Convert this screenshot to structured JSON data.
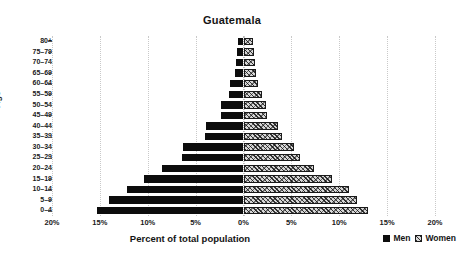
{
  "chart_data": {
    "type": "bar",
    "subtype": "population-pyramid",
    "title": "Guatemala",
    "xlabel": "Percent of total population",
    "ylabel": "Age",
    "categories": [
      "0–4",
      "5–9",
      "10–14",
      "15–19",
      "20–24",
      "25–29",
      "30–34",
      "35–39",
      "40–44",
      "45–49",
      "50–54",
      "55–59",
      "60–64",
      "65–69",
      "70–74",
      "75–79",
      "80+"
    ],
    "series": [
      {
        "name": "Men",
        "color": "#0d0d0d",
        "direction": "left",
        "values": [
          15.3,
          14.0,
          12.2,
          10.4,
          8.5,
          6.4,
          6.3,
          4.0,
          3.9,
          2.4,
          2.4,
          1.5,
          1.4,
          0.9,
          0.8,
          0.7,
          0.6
        ]
      },
      {
        "name": "Women",
        "color": "#d6d6d6",
        "direction": "right",
        "values": [
          13.0,
          11.9,
          11.0,
          9.2,
          7.4,
          5.9,
          5.3,
          4.0,
          3.6,
          2.5,
          2.4,
          1.9,
          1.5,
          1.3,
          1.2,
          1.1,
          1.0
        ]
      }
    ],
    "xlim": [
      -20,
      20
    ],
    "xticks": [
      -20,
      -15,
      -10,
      -5,
      0,
      5,
      10,
      15,
      20
    ],
    "xtick_labels": [
      "20%",
      "15%",
      "10%",
      "5%",
      "0%",
      "5%",
      "10%",
      "15%",
      "20%"
    ],
    "grid": true,
    "grid_axis": "x",
    "legend_position": "bottom-right",
    "legend_entries": [
      "Men",
      "Women"
    ]
  },
  "legend": {
    "men_label": "Men",
    "women_label": "Women"
  },
  "icons": {
    "men_swatch": "filled-square-icon",
    "women_swatch": "hatched-square-icon"
  }
}
